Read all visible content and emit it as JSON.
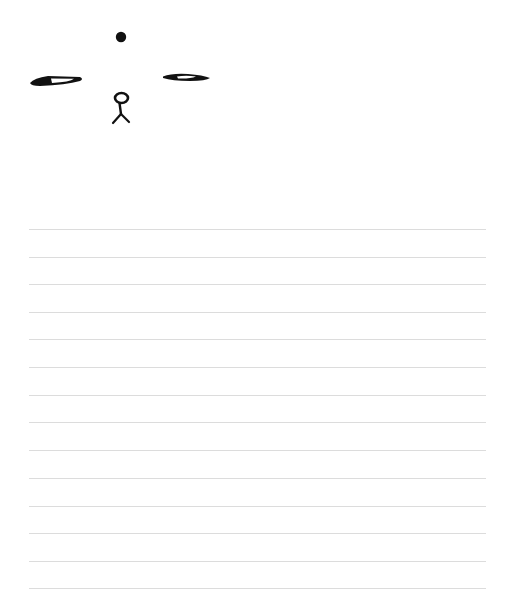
{
  "page": {
    "background": "#ffffff",
    "ink_color": "#111111",
    "rule_color": "#dcdcdc"
  },
  "glyphs": [
    {
      "name": "dot-icon",
      "shape": "filled circle"
    },
    {
      "name": "left-eye-icon",
      "shape": "elongated almond with white slot"
    },
    {
      "name": "right-eye-icon",
      "shape": "elongated almond with white slot"
    },
    {
      "name": "stick-figure-icon",
      "shape": "loop head on a forked stem"
    }
  ],
  "ruled_lines": {
    "count": 14,
    "first_y": 229,
    "spacing": 27.6,
    "left_x": 29,
    "width": 457
  }
}
